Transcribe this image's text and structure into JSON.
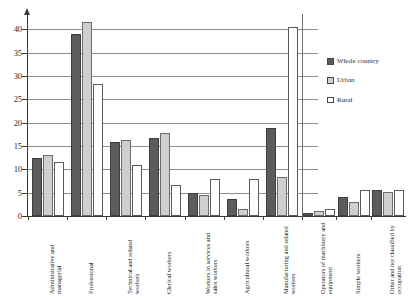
{
  "chart_data": {
    "type": "bar",
    "title": "",
    "subtitle": "",
    "xlabel": "",
    "ylabel": "",
    "ylim": [
      0,
      42
    ],
    "yticks": [
      0,
      5,
      10,
      15,
      20,
      25,
      30,
      35,
      40
    ],
    "ytick_labels": [
      "0",
      "5",
      "10",
      "15",
      "20",
      "25",
      "30",
      "35",
      "40"
    ],
    "grid": true,
    "legend_position": "right",
    "categories": [
      "Administrative and managerial",
      "Professional",
      "Technical and related workers",
      "Clerical workers",
      "Workers in services and sales workers",
      "Agricultural workers",
      "Manufacturing and related workers",
      "Operators of machinery and equipment",
      "Simple workers",
      "Other and not classified by occupation"
    ],
    "series": [
      {
        "name": "Whole country",
        "color": "#5c5c5c",
        "values": [
          12.5,
          39.0,
          15.9,
          16.8,
          5.0,
          3.7,
          18.8,
          0.7,
          4.0,
          5.5
        ]
      },
      {
        "name": "Urban",
        "color": "#cfcfcf",
        "values": [
          13.0,
          41.5,
          16.3,
          17.7,
          4.5,
          1.4,
          8.4,
          1.0,
          3.0,
          5.2
        ]
      },
      {
        "name": "Rural",
        "color": "#ffffff",
        "values": [
          11.6,
          28.2,
          11.0,
          6.6,
          8.0,
          8.0,
          40.5,
          1.4,
          5.5,
          5.5
        ]
      }
    ]
  },
  "legend": {
    "items": [
      {
        "label": "Whole country",
        "swatch": "whole-country-swatch"
      },
      {
        "label": "Urban",
        "swatch": "urban-swatch"
      },
      {
        "label": "Rural",
        "swatch": "rural-swatch"
      }
    ]
  }
}
